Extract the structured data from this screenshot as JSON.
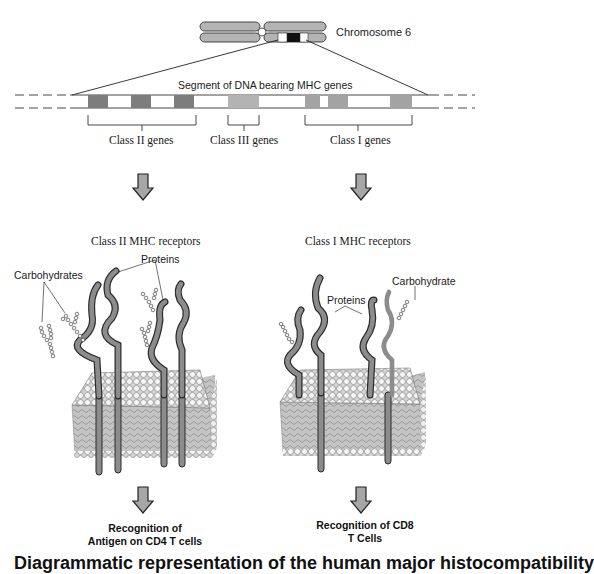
{
  "chromosome": {
    "label": "Chromosome 6"
  },
  "dna_segment": {
    "label": "Segment of DNA bearing MHC genes",
    "gene_groups": [
      {
        "name": "Class II genes",
        "block_count": 3,
        "shade": "#7a7a7a"
      },
      {
        "name": "Class III genes",
        "block_count": 1,
        "shade": "#b0b0b0"
      },
      {
        "name": "Class I genes",
        "block_count": 3,
        "shade": "#a0a0a0"
      }
    ]
  },
  "panels": [
    {
      "title": "Class II MHC receptors",
      "labels": {
        "carbohydrates": "Carbohydrates",
        "proteins": "Proteins"
      },
      "outcome": [
        "Recognition of",
        "Antigen on CD4 T cells"
      ]
    },
    {
      "title": "Class I MHC receptors",
      "labels": {
        "carbohydrate": "Carbohydrate",
        "proteins": "Proteins"
      },
      "outcome": [
        "Recognition of CD8",
        "T Cells"
      ]
    }
  ],
  "caption": "Diagrammatic representation of the human major histocompatibility",
  "colors": {
    "protein": "#8c8c8c",
    "protein_outline": "#2a2a2a",
    "membrane_head": "#f4f4f4",
    "membrane_tail": "#b8b8b8",
    "arrow_fill": "#a6a6a6"
  }
}
